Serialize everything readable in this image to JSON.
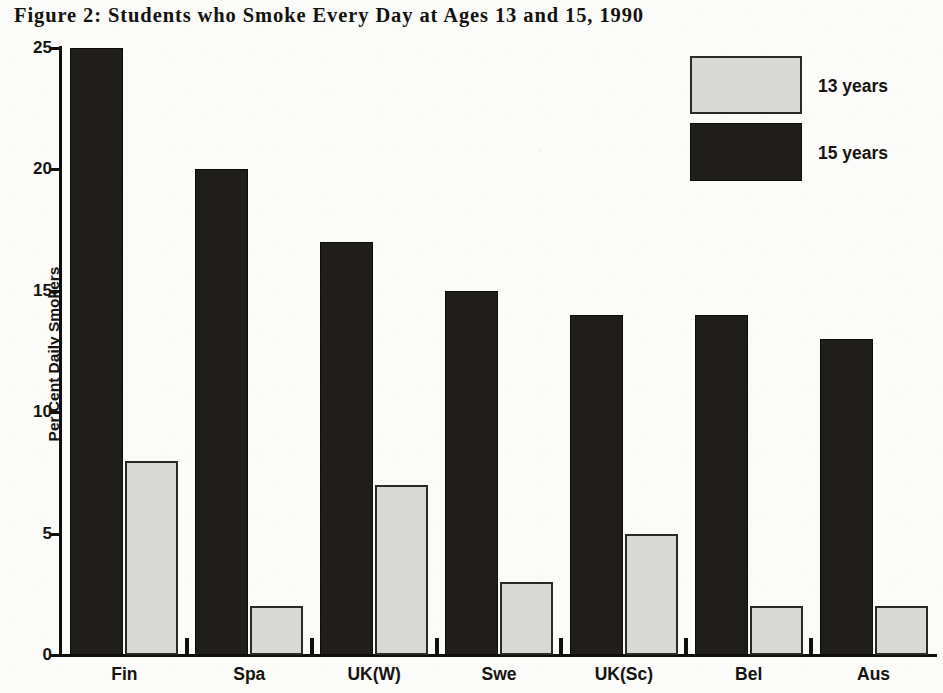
{
  "chart_data": {
    "type": "bar",
    "title": "Figure 2: Students who Smoke Every Day at Ages 13 and 15, 1990",
    "xlabel": "",
    "ylabel": "Per Cent Daily Smokers",
    "categories": [
      "Fin",
      "Spa",
      "UK(W)",
      "Swe",
      "UK(Sc)",
      "Bel",
      "Aus"
    ],
    "series": [
      {
        "name": "15 years",
        "values": [
          25,
          20,
          17,
          15,
          14,
          14,
          13
        ],
        "color": "#201e1c"
      },
      {
        "name": "13 years",
        "values": [
          8,
          2,
          7,
          3,
          5,
          2,
          2
        ],
        "color": "#d8d8d6"
      }
    ],
    "ylim": [
      0,
      25
    ],
    "yticks": [
      0,
      5,
      10,
      15,
      20,
      25
    ],
    "ytick_labels": [
      "0",
      "5",
      "10",
      "15",
      "20",
      "25"
    ],
    "grid": false,
    "legend_position": "top-right",
    "series_order_in_group": [
      "15 years",
      "13 years"
    ]
  },
  "legend": {
    "items": [
      {
        "label": "13 years",
        "swatch": "light"
      },
      {
        "label": "15 years",
        "swatch": "dark"
      }
    ]
  },
  "axes": {
    "y_title": "Per Cent Daily Smokers",
    "y_labels": [
      "25",
      "20",
      "15",
      "10",
      "5",
      "0"
    ],
    "x_labels": [
      "Fin",
      "Spa",
      "UK(W)",
      "Swe",
      "UK(Sc)",
      "Bel",
      "Aus"
    ]
  },
  "colors": {
    "dark_series": "#201e1c",
    "light_series": "#d8d8d6",
    "axis": "#100f0d",
    "text": "#16140f",
    "background": "#fbfbf9"
  }
}
